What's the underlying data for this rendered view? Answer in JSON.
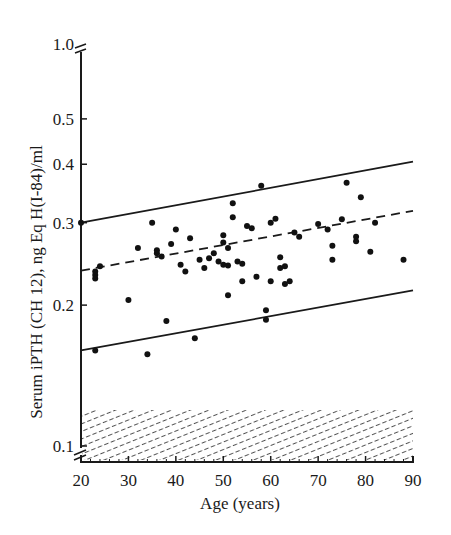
{
  "chart_data": {
    "type": "scatter",
    "title": "",
    "xlabel": "Age (years)",
    "ylabel": "Serum iPTH (CH 12), ng Eq H(I-84)/ml",
    "xlim": [
      20,
      90
    ],
    "ylim": [
      0.1,
      1.0
    ],
    "yscale": "log",
    "grid": false,
    "legend": null,
    "x_ticks": [
      "20",
      "30",
      "40",
      "50",
      "60",
      "70",
      "80",
      "90"
    ],
    "y_ticks": [
      "0.1",
      "0.2",
      "0.3",
      "0.4",
      "0.5",
      "1.0"
    ],
    "axis_breaks": [
      "y-axis between 0.5 and 1.0",
      "y-axis near 0.1 / origin"
    ],
    "shaded_region": {
      "description": "hatched band (detection limit region)",
      "y_from": 0.1,
      "y_to": 0.125,
      "x_from": 20,
      "x_to": 90
    },
    "lines": [
      {
        "name": "upper limit",
        "style": "solid",
        "x": [
          20,
          90
        ],
        "y": [
          0.3,
          0.405
        ]
      },
      {
        "name": "regression (mean)",
        "style": "dashed",
        "x": [
          20,
          90
        ],
        "y": [
          0.237,
          0.318
        ]
      },
      {
        "name": "lower limit",
        "style": "solid",
        "x": [
          20,
          90
        ],
        "y": [
          0.16,
          0.215
        ]
      }
    ],
    "series": [
      {
        "name": "subjects",
        "points": [
          [
            20,
            0.3
          ],
          [
            23,
            0.16
          ],
          [
            23,
            0.232
          ],
          [
            23,
            0.236
          ],
          [
            23,
            0.228
          ],
          [
            24,
            0.242
          ],
          [
            30,
            0.205
          ],
          [
            32,
            0.265
          ],
          [
            34,
            0.157
          ],
          [
            35,
            0.3
          ],
          [
            36,
            0.258
          ],
          [
            36,
            0.262
          ],
          [
            37,
            0.254
          ],
          [
            38,
            0.185
          ],
          [
            39,
            0.27
          ],
          [
            40,
            0.29
          ],
          [
            41,
            0.244
          ],
          [
            42,
            0.236
          ],
          [
            43,
            0.278
          ],
          [
            44,
            0.17
          ],
          [
            45,
            0.25
          ],
          [
            46,
            0.24
          ],
          [
            47,
            0.252
          ],
          [
            48,
            0.258
          ],
          [
            49,
            0.248
          ],
          [
            50,
            0.282
          ],
          [
            50,
            0.272
          ],
          [
            50,
            0.244
          ],
          [
            51,
            0.243
          ],
          [
            51,
            0.265
          ],
          [
            51,
            0.21
          ],
          [
            52,
            0.308
          ],
          [
            52,
            0.33
          ],
          [
            53,
            0.248
          ],
          [
            54,
            0.245
          ],
          [
            54,
            0.225
          ],
          [
            55,
            0.295
          ],
          [
            56,
            0.292
          ],
          [
            57,
            0.23
          ],
          [
            58,
            0.36
          ],
          [
            59,
            0.195
          ],
          [
            59,
            0.186
          ],
          [
            60,
            0.225
          ],
          [
            60,
            0.3
          ],
          [
            61,
            0.306
          ],
          [
            62,
            0.253
          ],
          [
            62,
            0.24
          ],
          [
            63,
            0.242
          ],
          [
            63,
            0.222
          ],
          [
            64,
            0.225
          ],
          [
            65,
            0.286
          ],
          [
            66,
            0.28
          ],
          [
            70,
            0.298
          ],
          [
            72,
            0.29
          ],
          [
            73,
            0.268
          ],
          [
            73,
            0.25
          ],
          [
            75,
            0.305
          ],
          [
            76,
            0.365
          ],
          [
            78,
            0.274
          ],
          [
            78,
            0.28
          ],
          [
            79,
            0.34
          ],
          [
            81,
            0.26
          ],
          [
            82,
            0.3
          ],
          [
            88,
            0.25
          ]
        ]
      }
    ]
  }
}
